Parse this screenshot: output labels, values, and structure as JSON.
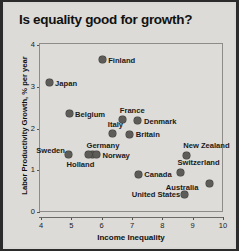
{
  "chart_data": {
    "type": "scatter",
    "title": "Is equality good for growth?",
    "xlabel": "Income Inequality",
    "ylabel": "Labor Productivity Growth, % per year",
    "xlim": [
      4,
      10
    ],
    "ylim": [
      0,
      4
    ],
    "xticks": [
      "4",
      "5",
      "6",
      "7",
      "8",
      "9",
      "10"
    ],
    "yticks": [
      "0",
      "1",
      "2",
      "3",
      "4"
    ],
    "grid": false,
    "legend": "none",
    "marker_color": "#5d5c59",
    "points": [
      {
        "label": "Finland",
        "x": 6.05,
        "y": 3.62,
        "label_dx": 6,
        "label_dy": -3
      },
      {
        "label": "Japan",
        "x": 4.3,
        "y": 3.07,
        "label_dx": 6,
        "label_dy": -3
      },
      {
        "label": "Belgium",
        "x": 4.96,
        "y": 2.33,
        "label_dx": 6,
        "label_dy": -3
      },
      {
        "label": "France",
        "x": 6.73,
        "y": 2.18,
        "label_dx": -3,
        "label_dy": -13
      },
      {
        "label": "Denmark",
        "x": 7.23,
        "y": 2.16,
        "label_dx": 6,
        "label_dy": -3
      },
      {
        "label": "Italy",
        "x": 6.4,
        "y": 1.85,
        "label_dx": -5,
        "label_dy": -13
      },
      {
        "label": "Britain",
        "x": 6.96,
        "y": 1.84,
        "label_dx": 6,
        "label_dy": -3
      },
      {
        "label": "Germany",
        "x": 5.73,
        "y": 1.35,
        "label_dx": -6,
        "label_dy": -13
      },
      {
        "label": "Holland",
        "x": 5.6,
        "y": 1.35,
        "label_dx": -22,
        "label_dy": 6
      },
      {
        "label": "Norway",
        "x": 5.86,
        "y": 1.35,
        "label_dx": 6,
        "label_dy": -3
      },
      {
        "label": "Sweden",
        "x": 4.93,
        "y": 1.35,
        "label_dx": -32,
        "label_dy": -8
      },
      {
        "label": "New Zealand",
        "x": 8.82,
        "y": 1.34,
        "label_dx": -3,
        "label_dy": -13
      },
      {
        "label": "Switzerland",
        "x": 8.63,
        "y": 0.93,
        "label_dx": -3,
        "label_dy": -13
      },
      {
        "label": "Canada",
        "x": 7.24,
        "y": 0.88,
        "label_dx": 6,
        "label_dy": -3
      },
      {
        "label": "Australia",
        "x": 9.6,
        "y": 0.66,
        "label_dx": -44,
        "label_dy": 1
      },
      {
        "label": "United States",
        "x": 8.77,
        "y": 0.4,
        "label_dx": -53,
        "label_dy": -3
      }
    ]
  }
}
